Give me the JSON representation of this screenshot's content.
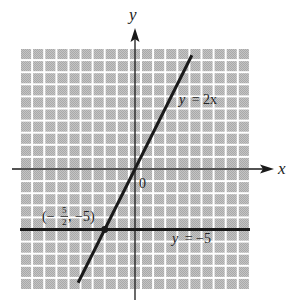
{
  "chart_data": {
    "type": "line",
    "title": "",
    "xlabel": "x",
    "ylabel": "y",
    "origin_label": "0",
    "grid": true,
    "xlim": [
      -9.5,
      9.5
    ],
    "ylim": [
      -10,
      10
    ],
    "series": [
      {
        "name": "y = 2x",
        "label_var": "y",
        "label_rhs": "= 2x",
        "slope": 2,
        "intercept": 0,
        "x": [
          -4.7,
          4.7
        ],
        "y": [
          -9.4,
          9.4
        ]
      },
      {
        "name": "y = -5",
        "label_var": "y",
        "label_rhs": "= −5",
        "slope": 0,
        "intercept": -5,
        "x": [
          -9.5,
          9.5
        ],
        "y": [
          -5,
          -5
        ]
      }
    ],
    "points": [
      {
        "x": -2.5,
        "y": -5,
        "label": "(−⅕₂, −5)",
        "label_open": "(−",
        "label_num": "5",
        "label_den": "2",
        "label_close": ", −5)"
      }
    ],
    "annotations": [
      "y = 2x",
      "y = −5",
      "(−5/2, −5)"
    ]
  },
  "colors": {
    "grid_cell": "#b9b9b9",
    "grid_gap": "#ffffff",
    "line": "#1a1a1a"
  }
}
